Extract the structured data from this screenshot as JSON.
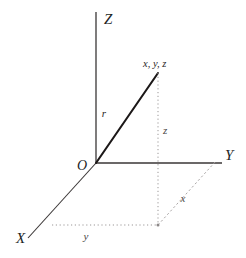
{
  "figure": {
    "type": "3d-cartesian-coordinate-diagram",
    "background_color": "#ffffff",
    "stroke_color": "#3a3636",
    "dotted_color": "#9b9797",
    "dashed_color": "#a9a5a5"
  },
  "axes": {
    "z": {
      "label": "Z",
      "label_x": 104,
      "label_y": 24,
      "from_x": 96,
      "from_y": 12,
      "to_x": 96,
      "to_y": 163
    },
    "y": {
      "label": "Y",
      "label_x": 225,
      "label_y": 160,
      "from_x": 96,
      "from_y": 163,
      "to_x": 222,
      "to_y": 163
    },
    "x": {
      "label": "X",
      "label_x": 16,
      "label_y": 243,
      "from_x": 96,
      "from_y": 163,
      "to_x": 28,
      "to_y": 238
    }
  },
  "origin": {
    "label": "O",
    "label_x": 82,
    "label_y": 170,
    "x": 96,
    "y": 163
  },
  "point": {
    "label": "x, y, z",
    "label_x": 143,
    "label_y": 67,
    "x": 158,
    "y": 73
  },
  "vector": {
    "label": "r",
    "label_x": 104,
    "label_y": 117,
    "from_x": 96,
    "from_y": 163,
    "to_x": 158,
    "to_y": 73
  },
  "projection": {
    "foot_x": 158,
    "foot_y": 225,
    "z_drop": {
      "from_x": 158,
      "from_y": 73,
      "to_x": 158,
      "to_y": 225
    },
    "y_run": {
      "from_x": 52,
      "from_y": 225,
      "to_x": 158,
      "to_y": 225
    },
    "x_run": {
      "from_x": 158,
      "from_y": 225,
      "to_x": 216,
      "to_y": 161
    }
  },
  "components": {
    "z": {
      "label": "z",
      "label_x": 163,
      "label_y": 134
    },
    "y": {
      "label": "y",
      "label_x": 86,
      "label_y": 240
    },
    "x": {
      "label": "x",
      "label_x": 183,
      "label_y": 202
    }
  }
}
